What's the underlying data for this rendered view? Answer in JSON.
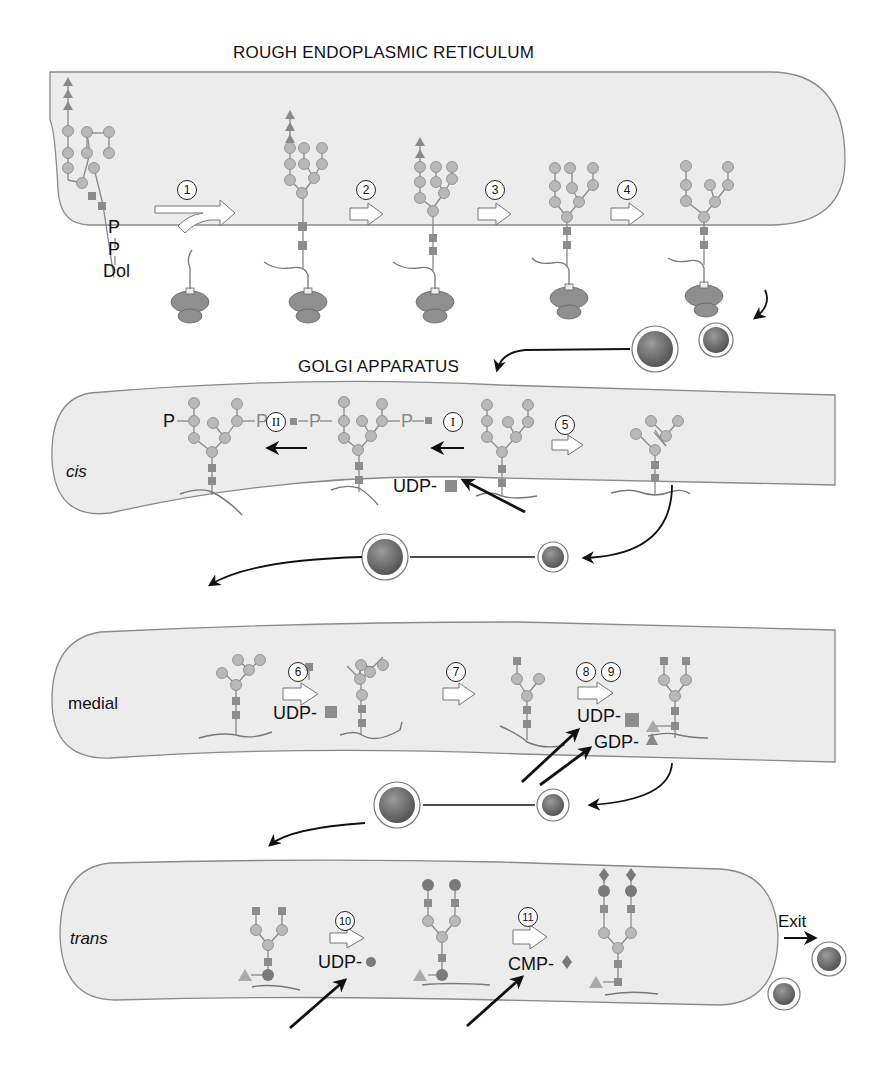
{
  "labels": {
    "er_title": "ROUGH ENDOPLASMIC RETICULUM",
    "golgi_title": "GOLGI APPARATUS",
    "cis": "cis",
    "medial": "medial",
    "trans": "trans",
    "exit": "Exit",
    "dol": "Dol",
    "p1": "P",
    "p2": "P",
    "cis_p_left": "P",
    "cis_p_mid1": "P",
    "cis_p_mid2": "P",
    "cis_p_right": "P",
    "udp_cis": "UDP-",
    "udp_medial_6": "UDP-",
    "udp_medial_8": "UDP-",
    "gdp_medial_9": "GDP-",
    "udp_trans_10": "UDP-",
    "cmp_trans_11": "CMP-"
  },
  "steps": {
    "s1": "1",
    "s2": "2",
    "s3": "3",
    "s4": "4",
    "s5": "5",
    "s6": "6",
    "s7": "7",
    "s8": "8",
    "s9": "9",
    "s10": "10",
    "s11": "11",
    "rI": "I",
    "rII": "II"
  },
  "colors": {
    "compartment_fill": "#ececec",
    "compartment_stroke": "#8a8a8a",
    "mannose_circle": "#b8b8b8",
    "glcnac_square": "#8c8c8c",
    "glucose_triangle": "#8a8a8a",
    "galactose_circle": "#7a7a7a",
    "sialic_diamond": "#7a7a7a",
    "vesicle_core": "#6e6e6e",
    "arrow": "#111111"
  }
}
